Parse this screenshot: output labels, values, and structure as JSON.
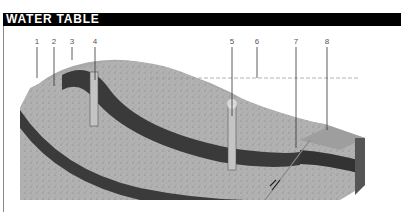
{
  "header": {
    "title": "WATER TABLE"
  },
  "labels": [
    {
      "id": "1",
      "text": "1",
      "x": 37
    },
    {
      "id": "2",
      "text": "2",
      "x": 54
    },
    {
      "id": "3",
      "text": "3",
      "x": 72
    },
    {
      "id": "4",
      "text": "4",
      "x": 95
    },
    {
      "id": "5",
      "text": "5",
      "x": 232
    },
    {
      "id": "6",
      "text": "6",
      "x": 257
    },
    {
      "id": "7",
      "text": "7",
      "x": 296
    },
    {
      "id": "8",
      "text": "8",
      "x": 327
    }
  ],
  "colors": {
    "header_bg": "#000000",
    "header_text": "#ffffff",
    "surface": "#a8a8a8",
    "permeable_rock": "#b4b4b4",
    "impermeable_rock": "#3a3a3a",
    "water_table_line": "#9a9a9a"
  }
}
